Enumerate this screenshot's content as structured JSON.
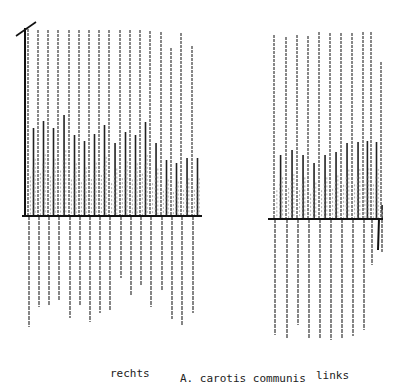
{
  "figure": {
    "caption": "A. carotis communis",
    "panels": [
      {
        "label": "rechts"
      },
      {
        "label": "links"
      }
    ]
  },
  "chart_data": [
    {
      "type": "line",
      "title": "rechts",
      "subtitle": "A. carotis communis",
      "xlabel": "",
      "ylabel": "",
      "grid": false,
      "description": "Doppler flow velocity pulse waveform, right common carotid artery; 17 cardiac cycles",
      "baseline_px": 216,
      "x_range_px": [
        22,
        202
      ],
      "peaks": {
        "x_px": [
          28,
          38,
          48,
          58,
          69,
          79,
          89,
          99,
          109,
          120,
          130,
          140,
          150,
          161,
          171,
          181,
          192
        ],
        "systolic_top_px": [
          29,
          30,
          30,
          30,
          30,
          30,
          30,
          30,
          30,
          30,
          30,
          30,
          31,
          32,
          48,
          33,
          46
        ],
        "secondary_top_px": [
          128,
          121,
          128,
          115,
          135,
          141,
          134,
          125,
          143,
          132,
          135,
          122,
          143,
          160,
          163,
          158,
          158
        ],
        "negative_bottom_px": [
          327,
          307,
          305,
          300,
          318,
          306,
          322,
          313,
          311,
          278,
          295,
          286,
          307,
          290,
          319,
          325,
          313
        ]
      }
    },
    {
      "type": "line",
      "title": "links",
      "subtitle": "A. carotis communis",
      "xlabel": "",
      "ylabel": "",
      "grid": false,
      "description": "Doppler flow velocity pulse waveform, left common carotid artery; 11 cardiac cycles",
      "baseline_px": 219,
      "x_range_px": [
        268,
        383
      ],
      "peaks": {
        "x_px": [
          274,
          286,
          297,
          308,
          319,
          330,
          341,
          352,
          363,
          371,
          381
        ],
        "systolic_top_px": [
          35,
          37,
          35,
          36,
          32,
          33,
          33,
          33,
          32,
          32,
          62
        ],
        "secondary_top_px": [
          155,
          150,
          155,
          163,
          155,
          152,
          143,
          142,
          141,
          142,
          205
        ],
        "negative_bottom_px": [
          335,
          338,
          325,
          338,
          338,
          340,
          338,
          336,
          330,
          265,
          252
        ]
      }
    }
  ]
}
